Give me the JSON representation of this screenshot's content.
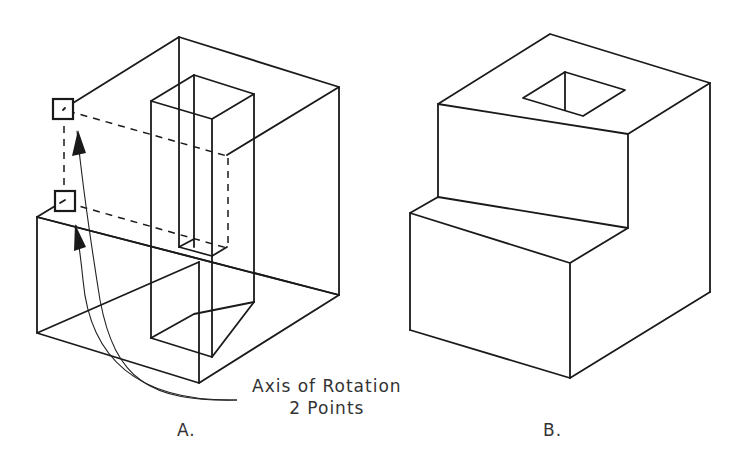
{
  "figure_a": {
    "label": "A.",
    "annotation": {
      "line1": "Axis of Rotation",
      "line2": "2 Points"
    },
    "markers": [
      {
        "name": "upper-point",
        "x": 63,
        "y": 110
      },
      {
        "name": "lower-point",
        "x": 64,
        "y": 201
      }
    ]
  },
  "figure_b": {
    "label": "B."
  },
  "colors": {
    "line": "#1a1a1a",
    "text": "#333333",
    "background": "#ffffff"
  }
}
